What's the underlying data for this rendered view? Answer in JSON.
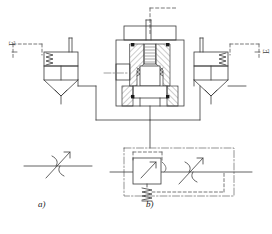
{
  "figure": {
    "type": "hydraulic-schematic",
    "title": "",
    "background_color": "#ffffff",
    "line_color": "#3a3a3a",
    "hatch_color": "#6b6b6b",
    "dash_color": "#555555"
  },
  "captions": [
    {
      "id": "caption-a",
      "label": "a)",
      "x": 38,
      "y": 203
    },
    {
      "id": "caption-b",
      "label": "b)",
      "x": 146,
      "y": 203
    }
  ],
  "annotations": {
    "left_symbol_label": "E",
    "right_symbol_label": "E"
  },
  "panels": [
    {
      "name": "left-pressure-compensator-symbol",
      "kind": "iso-symbol",
      "elements": [
        "spring",
        "control-line-dashed",
        "valve-body",
        "arrow-head",
        "port-lines"
      ]
    },
    {
      "name": "center-sectional-assembly",
      "kind": "section-drawing",
      "elements": [
        "housing",
        "spool",
        "seat",
        "hatching",
        "seal-squares",
        "centerline",
        "stem",
        "dashed-pilot-line"
      ]
    },
    {
      "name": "right-pressure-compensator-symbol",
      "kind": "iso-symbol",
      "elements": [
        "spring",
        "control-line-dashed",
        "valve-body",
        "arrow-head",
        "port-lines"
      ]
    },
    {
      "name": "bottom-left-variable-throttle-symbol",
      "kind": "iso-symbol",
      "elements": [
        "throttle-arcs",
        "adjust-arrow",
        "flow-line"
      ]
    },
    {
      "name": "bottom-center-flow-control-valve-symbol",
      "kind": "iso-symbol",
      "elements": [
        "enclosure-dash-dot",
        "compensator-box",
        "spring",
        "pilot-dashed-box",
        "throttle-arcs",
        "adjust-arrow",
        "flow-line"
      ]
    }
  ]
}
